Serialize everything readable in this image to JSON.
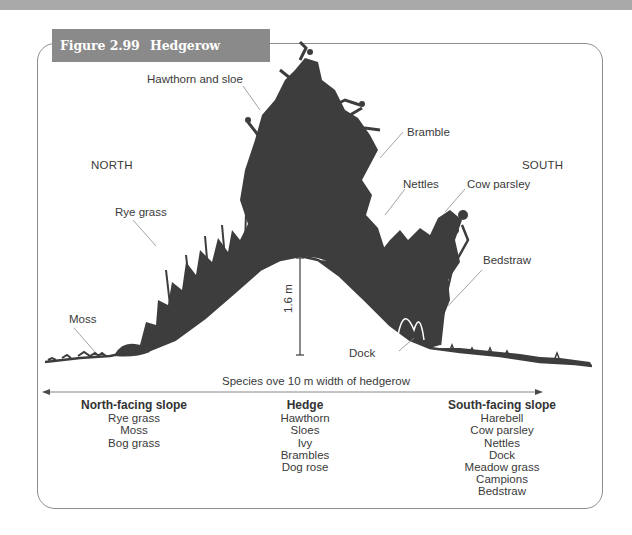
{
  "figure": {
    "number": "Figure 2.99",
    "title": "Hedgerow species survey"
  },
  "illustration": {
    "directions": {
      "left": "NORTH",
      "right": "SOUTH"
    },
    "labels": {
      "hawthorn_sloe": "Hawthorn and sloe",
      "bramble": "Bramble",
      "nettles": "Nettles",
      "cow_parsley": "Cow parsley",
      "rye_grass": "Rye grass",
      "bedstraw": "Bedstraw",
      "moss": "Moss",
      "dock": "Dock"
    },
    "height_marker": "1.6 m",
    "colors": {
      "vegetation": "#3d3d3d",
      "frame": "#8d8d8d",
      "tab": "#8a8a8a"
    }
  },
  "axis": {
    "caption": "Species ove 10 m width of hedgerow"
  },
  "columns": [
    {
      "heading": "North-facing slope",
      "species": [
        "Rye grass",
        "Moss",
        "Bog grass"
      ]
    },
    {
      "heading": "Hedge",
      "species": [
        "Hawthorn",
        "Sloes",
        "Ivy",
        "Brambles",
        "Dog rose"
      ]
    },
    {
      "heading": "South-facing slope",
      "species": [
        "Harebell",
        "Cow parsley",
        "Nettles",
        "Dock",
        "Meadow grass",
        "Campions",
        "Bedstraw"
      ]
    }
  ]
}
